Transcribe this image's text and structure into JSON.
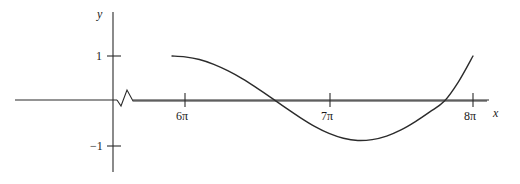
{
  "figure": {
    "kind": "cartesian-graph",
    "background_color": "#ffffff",
    "stroke_color": "#2b2b2b"
  },
  "axes": {
    "x_name": "x",
    "y_name": "y",
    "x_tick_labels": [
      "6π",
      "7π",
      "8π"
    ],
    "y_tick_labels": [
      "1",
      "−1"
    ],
    "axis_break_symbol": "zigzag"
  },
  "chart_data": {
    "type": "line",
    "title": "",
    "xlabel": "x",
    "ylabel": "y",
    "grid": false,
    "legend": null,
    "xlim": [
      0,
      8.55
    ],
    "ylim": [
      -1.35,
      1.35
    ],
    "x_unit": "pi",
    "x_ticks": [
      6,
      7,
      8
    ],
    "x_ticklabels": [
      "6π",
      "7π",
      "8π"
    ],
    "y_ticks": [
      1,
      -1
    ],
    "y_ticklabels": [
      "1",
      "−1"
    ],
    "axis_break": {
      "present": true,
      "x": 0.45,
      "style": "zigzag"
    },
    "series": [
      {
        "name": "curve",
        "x_domain_pi": [
          5.91,
          8.0
        ],
        "x": [
          5.91,
          6.0,
          6.1,
          6.2,
          6.3,
          6.4,
          6.5,
          6.6,
          6.7,
          6.8,
          6.9,
          7.0,
          7.1,
          7.2,
          7.3,
          7.4,
          7.5,
          7.6,
          7.7,
          7.8,
          7.9,
          8.0
        ],
        "y": [
          1.0,
          0.98,
          0.92,
          0.81,
          0.66,
          0.48,
          0.27,
          0.05,
          -0.18,
          -0.4,
          -0.6,
          -0.76,
          -0.87,
          -0.92,
          -0.9,
          -0.82,
          -0.68,
          -0.49,
          -0.27,
          -0.03,
          0.42,
          1.0
        ],
        "zero_crossings_pi": [
          6.52,
          7.93
        ],
        "minimum": {
          "x_pi": 7.2,
          "y": -0.92
        },
        "endpoints": [
          {
            "x_pi": 5.91,
            "y": 1.0
          },
          {
            "x_pi": 8.0,
            "y": 1.0
          }
        ]
      }
    ]
  }
}
